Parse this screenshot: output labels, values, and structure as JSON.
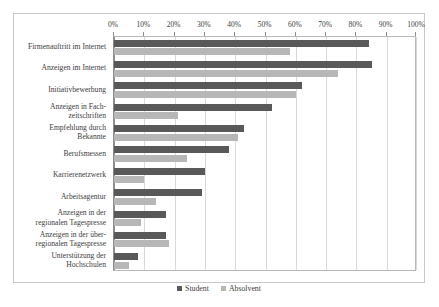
{
  "chart_data": {
    "type": "bar",
    "orientation": "horizontal",
    "title": "",
    "xlabel": "",
    "ylabel": "",
    "xlim": [
      0,
      100
    ],
    "x_tick_labels": [
      "0%",
      "10%",
      "20%",
      "30%",
      "40%",
      "50%",
      "60%",
      "70%",
      "80%",
      "90%",
      "100%"
    ],
    "x_tick_values": [
      0,
      10,
      20,
      30,
      40,
      50,
      60,
      70,
      80,
      90,
      100
    ],
    "grid": "vertical",
    "legend_position": "bottom-center",
    "categories": [
      "Firmenauftritt im Internet",
      "Anzeigen im Internet",
      "Initiativbewerbung",
      "Anzeigen in Fach-\nzeitschriften",
      "Empfehlung durch\nBekannte",
      "Berufsmessen",
      "Karrierenetzwerk",
      "Arbeitsagentur",
      "Anzeigen in der\nregionalen Tagespresse",
      "Anzeigen in der über-\nregionalen Tagespresse",
      "Unterstützung der\nHochschulen"
    ],
    "series": [
      {
        "name": "Student",
        "color": "#595959",
        "values": [
          84,
          85,
          62,
          52,
          43,
          38,
          30,
          29,
          17,
          17,
          8
        ]
      },
      {
        "name": "Absolvent",
        "color": "#b7b7b7",
        "values": [
          58,
          74,
          60,
          21,
          41,
          24,
          10,
          14,
          9,
          18,
          5
        ]
      }
    ]
  },
  "legend": {
    "entries": [
      {
        "label": "Student"
      },
      {
        "label": "Absolvent"
      }
    ]
  }
}
